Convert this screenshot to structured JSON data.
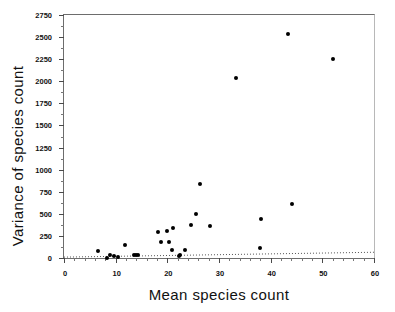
{
  "chart_data": {
    "type": "scatter",
    "title": "",
    "xlabel": "Mean species count",
    "ylabel": "Variance of species count",
    "xlim": [
      0,
      60
    ],
    "ylim": [
      0,
      2750
    ],
    "xticks": [
      0,
      10,
      20,
      30,
      40,
      50,
      60
    ],
    "yticks": [
      0,
      250,
      500,
      750,
      1000,
      1250,
      1500,
      1750,
      2000,
      2250,
      2500,
      2750
    ],
    "xtick_labels": [
      "0",
      "10",
      "20",
      "30",
      "40",
      "50",
      "60"
    ],
    "ytick_labels": [
      "0",
      "250",
      "500",
      "750",
      "1000",
      "1250",
      "1500",
      "1750",
      "2000",
      "2250",
      "2500",
      "2750"
    ],
    "xtick_minor_step": 2,
    "ytick_minor_step": 125,
    "grid": false,
    "legend": false,
    "marker": "filled-circle",
    "marker_color": "#000000",
    "series": [
      {
        "name": "species",
        "points": [
          [
            6.6,
            80
          ],
          [
            8.3,
            5
          ],
          [
            8.9,
            30
          ],
          [
            9.6,
            25
          ],
          [
            10.4,
            10
          ],
          [
            11.9,
            150
          ],
          [
            13.6,
            30
          ],
          [
            14.0,
            35
          ],
          [
            14.4,
            30
          ],
          [
            18.2,
            295
          ],
          [
            18.8,
            180
          ],
          [
            19.9,
            305
          ],
          [
            20.4,
            180
          ],
          [
            21.1,
            345
          ],
          [
            20.9,
            90
          ],
          [
            22.3,
            20
          ],
          [
            22.4,
            35
          ],
          [
            23.4,
            85
          ],
          [
            24.5,
            370
          ],
          [
            25.6,
            495
          ],
          [
            26.4,
            840
          ],
          [
            28.3,
            360
          ],
          [
            33.2,
            2040
          ],
          [
            38.0,
            110
          ],
          [
            38.2,
            445
          ],
          [
            43.4,
            2540
          ],
          [
            44.1,
            610
          ],
          [
            52.1,
            2250
          ]
        ]
      }
    ],
    "trend_line": {
      "style": "dotted",
      "color": "#555555",
      "x_start": 0,
      "y_start": 10,
      "x_end": 60,
      "y_end": 65
    }
  }
}
